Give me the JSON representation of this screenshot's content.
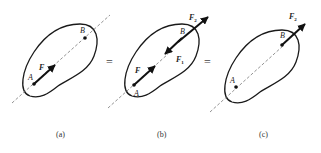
{
  "figure": {
    "panels": [
      {
        "id": "a",
        "caption": "(a)",
        "points": {
          "A": "A",
          "B": "B"
        },
        "forces": [
          {
            "label": "F",
            "at": "A"
          }
        ]
      },
      {
        "id": "b",
        "caption": "(b)",
        "points": {
          "A": "A",
          "B": "B"
        },
        "forces": [
          {
            "label": "F",
            "at": "A"
          },
          {
            "label": "F",
            "sub": "1",
            "at": "B"
          },
          {
            "label": "F",
            "sub": "2",
            "at": "B"
          }
        ]
      },
      {
        "id": "c",
        "caption": "(c)",
        "points": {
          "A": "A",
          "B": "B"
        },
        "forces": [
          {
            "label": "F",
            "sub": "2",
            "at": "B"
          }
        ]
      }
    ],
    "equals": [
      "=",
      "="
    ],
    "colors": {
      "stroke": "#1a1a1a",
      "dashed": "#777777"
    }
  }
}
